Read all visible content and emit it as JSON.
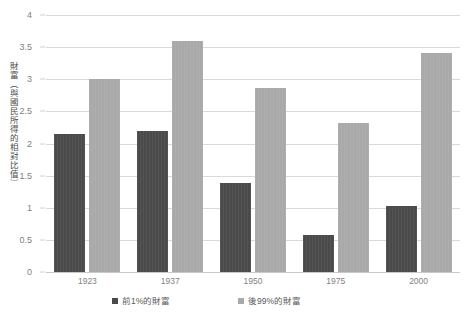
{
  "chart_data": {
    "type": "bar",
    "title": "",
    "xlabel": "",
    "ylabel": "財富（與國民所得的相對比值）",
    "categories": [
      "1923",
      "1937",
      "1950",
      "1975",
      "2000"
    ],
    "series": [
      {
        "name": "前1%的財富",
        "color": "#4a4a4a",
        "values": [
          2.15,
          2.19,
          1.38,
          0.57,
          1.02
        ]
      },
      {
        "name": "後99%的財富",
        "color": "#a9a9a9",
        "values": [
          3.0,
          3.6,
          2.87,
          2.32,
          3.41
        ]
      }
    ],
    "ylim": [
      0,
      4
    ],
    "yticks": [
      "0",
      "0.5",
      "1",
      "1.5",
      "2",
      "2.5",
      "3",
      "3.5",
      "4"
    ],
    "grid": true,
    "legend_position": "bottom"
  }
}
